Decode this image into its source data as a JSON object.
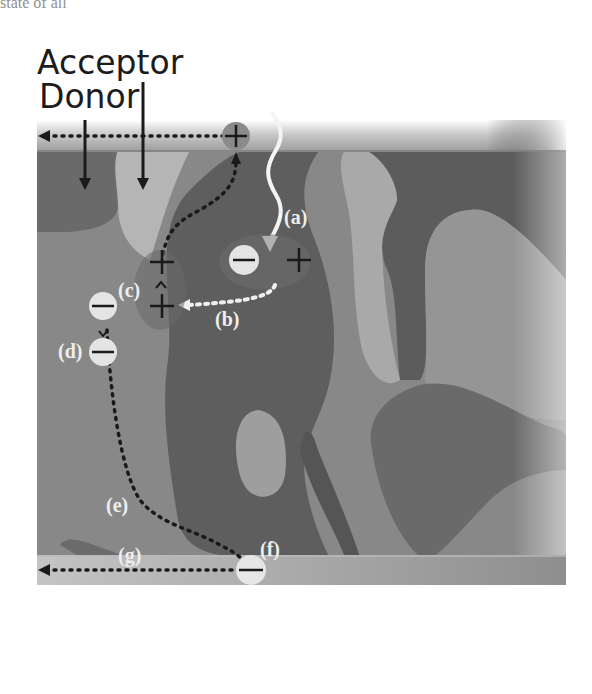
{
  "header": {
    "caption_fragment": "state of all",
    "layers": [
      {
        "name": "Acceptor",
        "label": "Acceptor"
      },
      {
        "name": "Donor",
        "label": "Donor"
      }
    ]
  },
  "steps": [
    {
      "id": "a",
      "label": "(a)",
      "description": "photon absorption / exciton generation"
    },
    {
      "id": "b",
      "label": "(b)",
      "description": "exciton diffusion to interface"
    },
    {
      "id": "c",
      "label": "(c)",
      "description": "charge transfer at interface"
    },
    {
      "id": "d",
      "label": "(d)",
      "description": "charge separation"
    },
    {
      "id": "e",
      "label": "(e)",
      "description": "electron transport through acceptor"
    },
    {
      "id": "f",
      "label": "(f)",
      "description": "electron extraction at electrode"
    },
    {
      "id": "g",
      "label": "(g)",
      "description": "current collection to external circuit"
    }
  ],
  "charges": {
    "plus": "+",
    "minus": "−"
  },
  "colors": {
    "background": "#ffffff",
    "donor_dark": "#5f5f5f",
    "acceptor_light": "#9a9a9a",
    "acceptor_lighter": "#b4b4b4",
    "electrode": "#a8a8a8",
    "electron_fill": "#e6e6e6",
    "hole_fill": "#8a8a8a",
    "label_white": "#eeeeee",
    "arrow_dark": "#1a1a1a"
  }
}
